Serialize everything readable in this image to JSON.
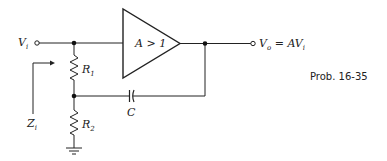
{
  "figure": {
    "caption": "Prob. 16-35",
    "amplifier": {
      "label": "A > 1"
    },
    "input": {
      "symbol": "V",
      "subscript": "i"
    },
    "output": {
      "symbol": "V",
      "subscript": "o",
      "equation": "= AV",
      "equation_subscript": "i"
    },
    "impedance": {
      "symbol": "Z",
      "subscript": "i"
    },
    "resistors": [
      {
        "symbol": "R",
        "subscript": "1"
      },
      {
        "symbol": "R",
        "subscript": "2"
      }
    ],
    "capacitor": {
      "symbol": "C"
    },
    "colors": {
      "line": "#222222",
      "background": "#ffffff"
    }
  }
}
